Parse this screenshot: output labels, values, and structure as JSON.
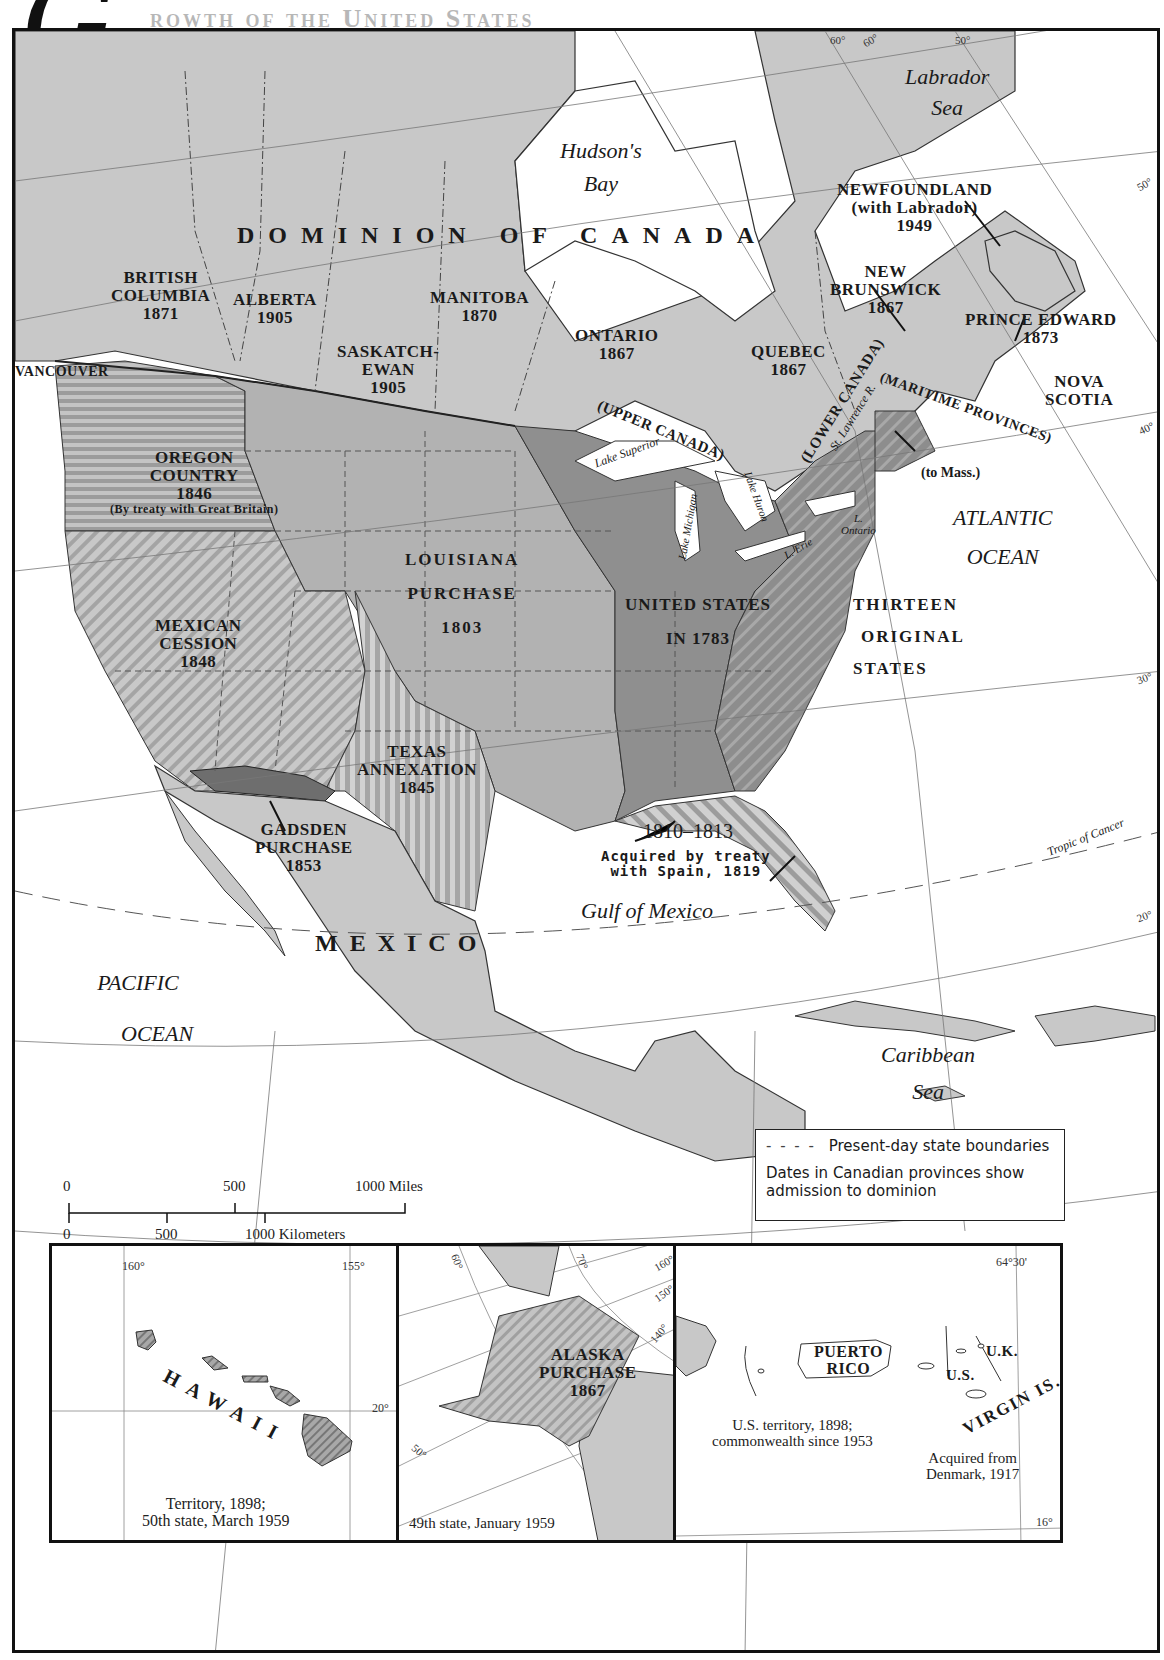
{
  "title": {
    "initial": "G",
    "rest": "rowth of the United States"
  },
  "colors": {
    "land": "#c8c8c8",
    "land_dark": "#9a9a9a",
    "us_1783": "#8f8f8f",
    "louisiana": "#b0b0b0",
    "gadsden": "#6e6e6e",
    "water": "#ffffff",
    "border": "#222222"
  },
  "water_labels": {
    "labrador_sea": [
      "Labrador",
      "Sea"
    ],
    "hudsons_bay": [
      "Hudson's",
      "Bay"
    ],
    "atlantic": [
      "ATLANTIC",
      "OCEAN"
    ],
    "pacific": [
      "PACIFIC",
      "OCEAN"
    ],
    "gulf": "Gulf of Mexico",
    "caribbean": [
      "Caribbean",
      "Sea"
    ],
    "tropic": "Tropic of Cancer"
  },
  "canada": {
    "title": "DOMINION OF CANADA",
    "provinces": [
      {
        "name": "BRITISH",
        "name2": "COLUMBIA",
        "year": "1871"
      },
      {
        "name": "ALBERTA",
        "year": "1905"
      },
      {
        "name": "SASKATCH-",
        "name2": "EWAN",
        "year": "1905"
      },
      {
        "name": "MANITOBA",
        "year": "1870"
      },
      {
        "name": "ONTARIO",
        "year": "1867"
      },
      {
        "name": "QUEBEC",
        "year": "1867"
      },
      {
        "name": "NEW",
        "name2": "BRUNSWICK",
        "year": "1867"
      },
      {
        "name": "PRINCE EDWARD",
        "year": "1873"
      },
      {
        "name": "NOVA",
        "name2": "SCOTIA"
      },
      {
        "name": "NEWFOUNDLAND",
        "name2": "(with Labrador)",
        "year": "1949"
      }
    ],
    "historic": {
      "upper": "(UPPER CANADA)",
      "lower": "(LOWER CANADA)",
      "maritime": "(MARITIME PROVINCES)",
      "st_lawrence": "St. Lawrence R.",
      "to_mass": "(to Mass.)",
      "vancouver": "VANCOUVER"
    }
  },
  "lakes": {
    "superior": "Lake Superior",
    "michigan": "Lake Michigan",
    "huron": "Lake Huron",
    "erie": "L. Erie",
    "ontario": [
      "L.",
      "Ontario"
    ]
  },
  "us_regions": [
    {
      "id": "oregon",
      "lines": [
        "OREGON",
        "COUNTRY",
        "1846"
      ],
      "note": "(By treaty with Great Britain)"
    },
    {
      "id": "louisiana",
      "lines": [
        "LOUISIANA",
        "PURCHASE",
        "1803"
      ]
    },
    {
      "id": "us1783",
      "lines": [
        "UNITED STATES",
        "IN 1783"
      ]
    },
    {
      "id": "thirteen",
      "lines": [
        "THIRTEEN",
        "ORIGINAL",
        "STATES"
      ]
    },
    {
      "id": "mexican",
      "lines": [
        "MEXICAN",
        "CESSION",
        "1848"
      ]
    },
    {
      "id": "texas",
      "lines": [
        "TEXAS",
        "ANNEXATION",
        "1845"
      ]
    },
    {
      "id": "gadsden",
      "lines": [
        "GADSDEN",
        "PURCHASE",
        "1853"
      ]
    },
    {
      "id": "westfla",
      "lines": [
        "1810–1813"
      ]
    },
    {
      "id": "florida",
      "lines": [
        "Acquired by treaty",
        "with Spain, 1819"
      ]
    }
  ],
  "mexico": "MEXICO",
  "graticule": {
    "labels": [
      "60°",
      "60°",
      "50°",
      "50°",
      "40°",
      "30°",
      "20°"
    ]
  },
  "scale": {
    "miles": [
      "0",
      "500",
      "1000 Miles"
    ],
    "km": [
      "0",
      "500",
      "1000 Kilometers"
    ]
  },
  "legend": {
    "dash": "- - - -",
    "boundaries": "Present-day state boundaries",
    "note": "Dates in Canadian provinces show admission to dominion"
  },
  "insets": {
    "hawaii": {
      "name": "HAWAII",
      "lon": [
        "160°",
        "155°"
      ],
      "lat": "20°",
      "caption": [
        "Territory, 1898;",
        "50th state, March 1959"
      ]
    },
    "alaska": {
      "lines": [
        "ALASKA",
        "PURCHASE",
        "1867"
      ],
      "degs": [
        "60°",
        "70°",
        "160°",
        "150°",
        "140°",
        "50°"
      ],
      "caption": "49th state, January 1959"
    },
    "caribbean": {
      "pr": [
        "PUERTO",
        "RICO"
      ],
      "pr_caption": [
        "U.S. territory, 1898;",
        "commonwealth since 1953"
      ],
      "us": "U.S.",
      "uk": "U.K.",
      "vi": "VIRGIN IS.",
      "vi_caption": [
        "Acquired from",
        "Denmark, 1917"
      ],
      "lon": "64°30'",
      "lat": "16°"
    }
  }
}
